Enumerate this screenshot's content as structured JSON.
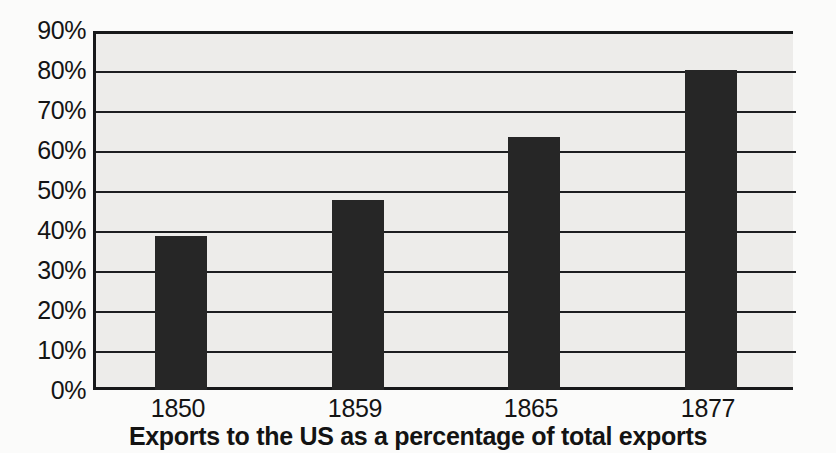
{
  "chart_data": {
    "type": "bar",
    "title": "",
    "subtitle": "",
    "caption": "Exports to the US as a percentage of total exports",
    "categories": [
      "1850",
      "1859",
      "1865",
      "1877"
    ],
    "values": [
      39,
      48,
      64,
      81
    ],
    "value_suffix": "%",
    "series": [
      {
        "name": "Exports to the US as a percentage of total exports",
        "values": [
          39,
          48,
          64,
          81
        ],
        "color": "#262626"
      }
    ],
    "xlabel": "",
    "ylabel": "",
    "ylim": [
      0,
      90
    ],
    "ytick_step": 10,
    "ytick_labels": [
      "90%",
      "80%",
      "70%",
      "60%",
      "50%",
      "40%",
      "30%",
      "20%",
      "10%",
      "0%"
    ],
    "ytick_values": [
      90,
      80,
      70,
      60,
      50,
      40,
      30,
      20,
      10,
      0
    ],
    "grid": true,
    "grid_axis": "y",
    "legend": false,
    "legend_position": "none",
    "annotations": [],
    "colors": {
      "bar": "#262626",
      "plot_background": "#edecea",
      "figure_background": "#fbfbfa",
      "axis_line": "#17181a",
      "gridline": "#1d1e20",
      "text": "#141414"
    }
  }
}
